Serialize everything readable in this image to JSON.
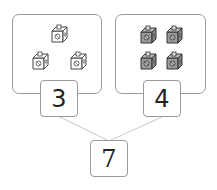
{
  "diagram": {
    "type": "number-bond",
    "left_group": {
      "count": 3,
      "label": "3",
      "cube_style": "outline"
    },
    "right_group": {
      "count": 4,
      "label": "4",
      "cube_style": "gray"
    },
    "total": {
      "label": "7"
    }
  },
  "colors": {
    "border": "#9a9a9a",
    "connector": "#c8c8c8",
    "cube_gray_fill": "#9b9b9b",
    "cube_outline_fill": "#ffffff",
    "text": "#222222"
  }
}
